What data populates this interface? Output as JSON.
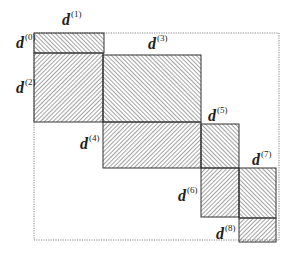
{
  "diagram": {
    "outer_frame": {
      "x": 34,
      "y": 33,
      "width": 245,
      "height": 207,
      "style": "dotted"
    },
    "blocks": [
      {
        "id": "d0",
        "x": 34,
        "y": 33,
        "width": 70,
        "height": 20,
        "hatch": "forward"
      },
      {
        "id": "d2",
        "x": 34,
        "y": 53,
        "width": 69,
        "height": 69,
        "hatch": "back"
      },
      {
        "id": "d3",
        "x": 103,
        "y": 55,
        "width": 98,
        "height": 67,
        "hatch": "forward"
      },
      {
        "id": "d4",
        "x": 103,
        "y": 122,
        "width": 98,
        "height": 46,
        "hatch": "back"
      },
      {
        "id": "d5",
        "x": 201,
        "y": 124,
        "width": 38,
        "height": 44,
        "hatch": "forward"
      },
      {
        "id": "d6",
        "x": 201,
        "y": 168,
        "width": 38,
        "height": 49,
        "hatch": "back"
      },
      {
        "id": "d7",
        "x": 239,
        "y": 168,
        "width": 37,
        "height": 50,
        "hatch": "forward"
      },
      {
        "id": "d8",
        "x": 239,
        "y": 218,
        "width": 37,
        "height": 24,
        "hatch": "back"
      }
    ],
    "labels": [
      {
        "id": "d0",
        "base": "d",
        "sup": "(0)",
        "x": 16,
        "y": 35
      },
      {
        "id": "d1",
        "base": "d",
        "sup": "(1)",
        "x": 62,
        "y": 12
      },
      {
        "id": "d2",
        "base": "d",
        "sup": "(2)",
        "x": 16,
        "y": 80
      },
      {
        "id": "d3",
        "base": "d",
        "sup": "(3)",
        "x": 148,
        "y": 36
      },
      {
        "id": "d4",
        "base": "d",
        "sup": "(4)",
        "x": 80,
        "y": 136
      },
      {
        "id": "d5",
        "base": "d",
        "sup": "(5)",
        "x": 208,
        "y": 108
      },
      {
        "id": "d6",
        "base": "d",
        "sup": "(6)",
        "x": 178,
        "y": 188
      },
      {
        "id": "d7",
        "base": "d",
        "sup": "(7)",
        "x": 252,
        "y": 152
      },
      {
        "id": "d8",
        "base": "d",
        "sup": "(8)",
        "x": 216,
        "y": 226
      }
    ],
    "colors": {
      "hatch": "#555555",
      "border": "#333333",
      "frame": "#666666",
      "background": "#ffffff"
    }
  }
}
